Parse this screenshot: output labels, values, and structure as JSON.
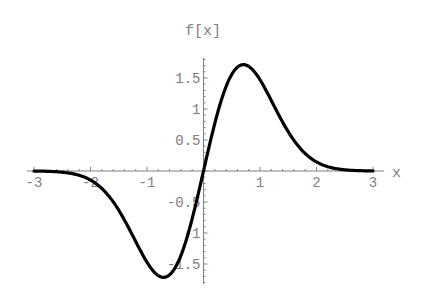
{
  "chart_data": {
    "type": "line",
    "title": "",
    "xlabel": "x",
    "ylabel": "f[x]",
    "xlim": [
      -3,
      3
    ],
    "ylim": [
      -1.8,
      1.8
    ],
    "x_ticks": [
      -3,
      -2,
      -1,
      1,
      2,
      3
    ],
    "x_tick_labels": [
      "-3",
      "-2",
      "-1",
      "1",
      "2",
      "3"
    ],
    "y_ticks": [
      -1.5,
      -1,
      -0.5,
      0.5,
      1,
      1.5
    ],
    "y_tick_labels": [
      "-1.5",
      "-1",
      "-0.5",
      "0.5",
      "1",
      "1.5"
    ],
    "grid": false,
    "legend": null,
    "series": [
      {
        "name": "f[x]",
        "expression": "4 x Exp[-x^2]",
        "x": [
          -3,
          -2.5,
          -2,
          -1.5,
          -1.25,
          -1,
          -0.75,
          -0.5,
          -0.25,
          0,
          0.25,
          0.5,
          0.75,
          1,
          1.25,
          1.5,
          2,
          2.5,
          3
        ],
        "values": [
          0.0015,
          -0.019,
          -0.147,
          -0.632,
          -1.048,
          -1.472,
          -1.71,
          -1.558,
          -0.939,
          0,
          0.939,
          1.558,
          1.71,
          1.472,
          1.048,
          0.632,
          0.147,
          0.019,
          0.0015
        ],
        "color": "#000000"
      }
    ],
    "extrema": {
      "max": {
        "x": 0.707,
        "y": 1.716
      },
      "min": {
        "x": -0.707,
        "y": -1.716
      }
    }
  },
  "style": {
    "axis_color": "#808080",
    "curve_color": "#000000"
  }
}
